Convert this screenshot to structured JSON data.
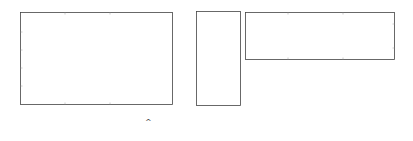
{
  "figure": {
    "equals_sign": "=",
    "formula": {
      "lhs": "X",
      "lhs_sub": "3",
      "eq": " = ",
      "u": "U",
      "u_sub": "3",
      "s": "S",
      "s_sub": "3",
      "dot": " • ",
      "v": "V",
      "v_sub": "3",
      "v_sup": "T"
    },
    "panels": [
      {
        "name": "data-matrix-spectra",
        "description": "Overlaid spectra (reconstructed data matrix)"
      },
      {
        "name": "scores-U3S3",
        "description": "Three score/concentration profiles with markers"
      },
      {
        "name": "loadings-V3T",
        "description": "Three loading vectors"
      }
    ]
  },
  "chart_data": [
    {
      "type": "line",
      "title": "",
      "xlabel": "",
      "ylabel": "",
      "note": "Family of ~15 overlaid spectra with peaks growing in intensity",
      "peaks_relative_x": [
        0.24,
        0.59,
        0.84,
        1.0
      ],
      "peak_max_relative_height": [
        0.25,
        0.95,
        0.5,
        0.7
      ]
    },
    {
      "type": "line",
      "title": "",
      "note": "3 profiles plotted vertically with circle markers",
      "series_count": 3
    },
    {
      "type": "line",
      "title": "",
      "note": "3 loading vectors, flat baseline then derivative-like features",
      "series_count": 3
    }
  ]
}
